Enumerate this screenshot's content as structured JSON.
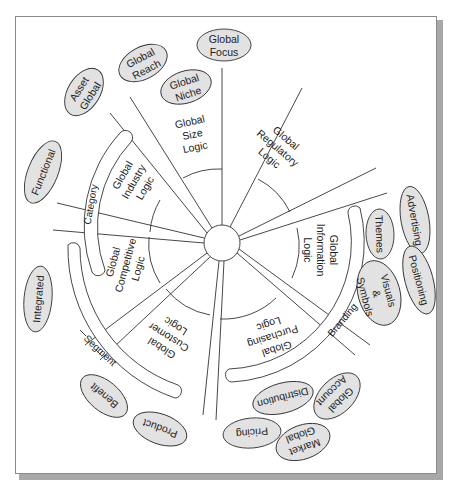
{
  "diagram": {
    "center": "hub",
    "logics": [
      {
        "id": "size",
        "lines": [
          "Global",
          "Size",
          "Logic"
        ]
      },
      {
        "id": "regulatory",
        "lines": [
          "Global",
          "Regulatory",
          "Logic"
        ]
      },
      {
        "id": "information",
        "lines": [
          "Global",
          "Information",
          "Logic"
        ]
      },
      {
        "id": "purchasing",
        "lines": [
          "Global",
          "Purchasing",
          "Logic"
        ]
      },
      {
        "id": "customer",
        "lines": [
          "Global",
          "Customer",
          "Logic"
        ]
      },
      {
        "id": "competitive",
        "lines": [
          "Global",
          "Competitive",
          "Logic"
        ]
      },
      {
        "id": "industry",
        "lines": [
          "Global",
          "Industry",
          "Logic"
        ]
      }
    ],
    "bands": {
      "category": "Category",
      "segment": "Segment",
      "branding": "Branding"
    },
    "nodes": {
      "global_focus": [
        "Global",
        "Focus"
      ],
      "global_reach": [
        "Global",
        "Reach"
      ],
      "global_niche": [
        "Global",
        "Niche"
      ],
      "asset_global": [
        "Asset",
        "Global"
      ],
      "functional": [
        "Functional"
      ],
      "integrated": [
        "Integrated"
      ],
      "benefit": [
        "Benefit"
      ],
      "product": [
        "Product"
      ],
      "pricing": [
        "Pricing"
      ],
      "market_global": [
        "Market",
        "Global"
      ],
      "distribution": [
        "Distribution"
      ],
      "global_account": [
        "Global",
        "Account"
      ],
      "advertising": [
        "Advertising"
      ],
      "themes": [
        "Themes"
      ],
      "positioning": [
        "Positioning"
      ],
      "visuals_symbols": [
        "Visuals",
        "&",
        "Symbols"
      ]
    },
    "colors": {
      "node_fill": "#e2e2e2",
      "stroke": "#333333",
      "frame_shadow": "#a8a8a8"
    }
  }
}
